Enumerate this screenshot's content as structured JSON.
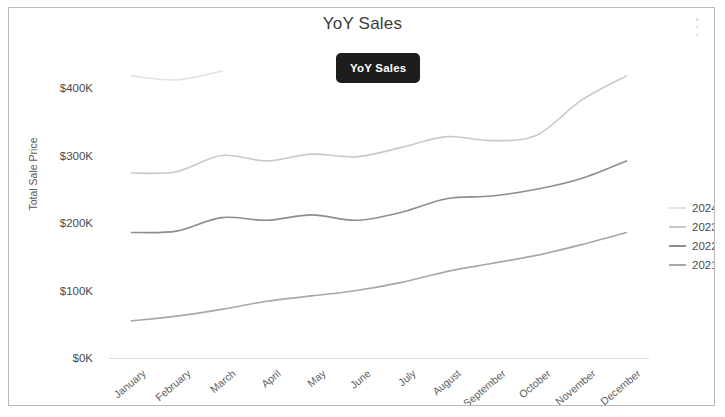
{
  "card": {
    "title": "YoY Sales",
    "menu_icon": "kebab-menu-icon"
  },
  "tooltip": {
    "label": "YoY Sales"
  },
  "legend": {
    "position": "right",
    "entries": [
      {
        "label": "2024",
        "color": "#e3e3e3"
      },
      {
        "label": "2023",
        "color": "#c9c9c9"
      },
      {
        "label": "2022",
        "color": "#8e8e8e"
      },
      {
        "label": "2021",
        "color": "#a8a8a8"
      }
    ]
  },
  "chart_data": {
    "type": "line",
    "title": "YoY Sales",
    "xlabel": "",
    "ylabel": "Total Sale Price",
    "categories": [
      "January",
      "February",
      "March",
      "April",
      "May",
      "June",
      "July",
      "August",
      "September",
      "October",
      "November",
      "December"
    ],
    "ytick_labels": [
      "$0K",
      "$100K",
      "$200K",
      "$300K",
      "$400K"
    ],
    "ytick_values": [
      0,
      100000,
      200000,
      300000,
      400000
    ],
    "ylim": [
      0,
      450000
    ],
    "grid": false,
    "series": [
      {
        "name": "2024",
        "color": "#e3e3e3",
        "values": [
          418000,
          412000,
          425000,
          null,
          null,
          null,
          null,
          null,
          null,
          null,
          null,
          null
        ]
      },
      {
        "name": "2023",
        "color": "#c9c9c9",
        "values": [
          274000,
          276000,
          300000,
          292000,
          302000,
          298000,
          312000,
          328000,
          322000,
          330000,
          382000,
          418000
        ]
      },
      {
        "name": "2022",
        "color": "#8e8e8e",
        "values": [
          186000,
          188000,
          208000,
          204000,
          212000,
          204000,
          216000,
          236000,
          240000,
          250000,
          266000,
          292000
        ]
      },
      {
        "name": "2021",
        "color": "#a8a8a8",
        "values": [
          55000,
          62000,
          72000,
          84000,
          92000,
          100000,
          112000,
          128000,
          140000,
          152000,
          168000,
          186000
        ]
      }
    ]
  }
}
